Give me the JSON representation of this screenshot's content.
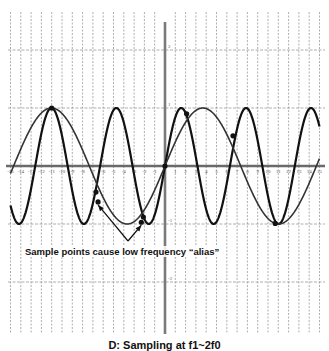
{
  "chart_data": {
    "type": "line",
    "title": "D: Sampling at f1~2f0",
    "xlabel": "",
    "ylabel": "",
    "xlim": [
      -15,
      15
    ],
    "ylim": [
      -2.8,
      2.6
    ],
    "grid": true,
    "x_ticks": [
      -15,
      -14,
      -13,
      -12,
      -11,
      -10,
      -9,
      -8,
      -7,
      -6,
      -5,
      -4,
      -3,
      -2,
      -1,
      1,
      2,
      3,
      4,
      5,
      6,
      7,
      8,
      9,
      10,
      11,
      12,
      13,
      14,
      15
    ],
    "y_ticks": [
      -2,
      -1,
      1,
      2
    ],
    "series": [
      {
        "name": "signal (high frequency)",
        "function": "sin(2*pi*x/6.3)",
        "period": 6.3,
        "amplitude": 1,
        "color": "#111111",
        "width": 2.2
      },
      {
        "name": "alias (low frequency)",
        "function": "sin(2*pi*x/14.7)",
        "period": 14.7,
        "amplitude": 1,
        "color": "#333333",
        "width": 1.6
      }
    ],
    "sample_points": [
      {
        "x": -11,
        "y": 1
      },
      {
        "x": -6.7,
        "y": -0.45
      },
      {
        "x": -6.5,
        "y": -0.62
      },
      {
        "x": -2.1,
        "y": -0.88
      },
      {
        "x": -2.3,
        "y": -0.97
      },
      {
        "x": 0,
        "y": 0
      },
      {
        "x": 2.1,
        "y": 0.9
      },
      {
        "x": 6.6,
        "y": 0.52
      },
      {
        "x": 10.7,
        "y": -0.99
      }
    ],
    "annotations": [
      {
        "text": "Sample points cause low frequency “alias”",
        "arrows_to": [
          {
            "x": -6.5,
            "y": -0.62
          },
          {
            "x": -2.3,
            "y": -0.97
          }
        ]
      }
    ]
  },
  "annotation": {
    "text": "Sample points cause low frequency “alias”"
  },
  "caption": {
    "text": "D: Sampling at f1~2f0"
  }
}
